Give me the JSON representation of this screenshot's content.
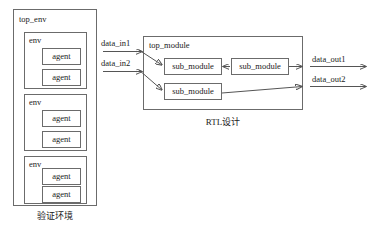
{
  "diagram": {
    "left_section": {
      "caption": "验证环境",
      "outer_box_label": "top_env",
      "envs": [
        {
          "label": "env",
          "agents": [
            "agent",
            "agent"
          ]
        },
        {
          "label": "env",
          "agents": [
            "agent",
            "agent"
          ]
        },
        {
          "label": "env",
          "agents": [
            "agent",
            "agent"
          ]
        }
      ]
    },
    "right_section": {
      "caption": "RTL设计",
      "outer_box_label": "top_module",
      "sub_modules": [
        {
          "label": "sub_module"
        },
        {
          "label": "sub_module"
        },
        {
          "label": "sub_module"
        }
      ]
    },
    "signals": {
      "inputs": [
        {
          "label": "data_in1"
        },
        {
          "label": "data_in2"
        }
      ],
      "outputs": [
        {
          "label": "data_out1"
        },
        {
          "label": "data_out2"
        }
      ]
    },
    "colors": {
      "stroke": "#6b6b6b",
      "wire": "#555555",
      "text": "#1a1a1a",
      "background": "#ffffff"
    }
  }
}
